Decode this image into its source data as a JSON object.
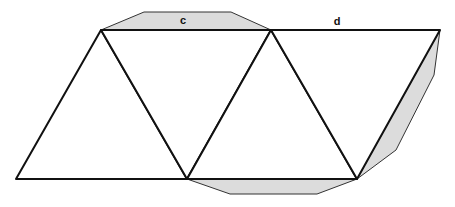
{
  "diagram": {
    "type": "polyhedron-net",
    "labels": {
      "c": "c",
      "d": "d"
    },
    "colors": {
      "edge": "#111111",
      "tab_fill": "#dcdcdc",
      "tab_edge": "#333333",
      "background": "#ffffff"
    }
  }
}
